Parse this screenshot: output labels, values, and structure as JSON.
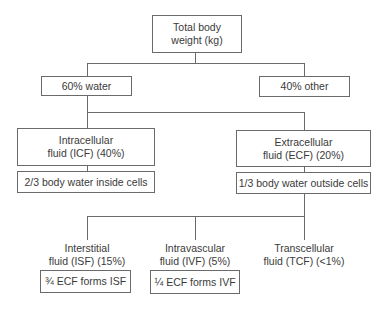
{
  "diagram": {
    "root": {
      "line1": "Total body",
      "line2": "weight (kg)"
    },
    "level1": {
      "water": "60% water",
      "other": "40% other"
    },
    "level2": {
      "icf": {
        "line1": "Intracellular",
        "line2": "fluid (ICF) (40%)",
        "note": "2/3 body water inside cells"
      },
      "ecf": {
        "line1": "Extracellular",
        "line2": "fluid (ECF) (20%)",
        "note": "1/3 body water outside cells"
      }
    },
    "level3": {
      "isf": {
        "line1": "Interstitial",
        "line2": "fluid (ISF) (15%)",
        "note": "¾ ECF forms ISF"
      },
      "ivf": {
        "line1": "Intravascular",
        "line2": "fluid (IVF) (5%)",
        "note": "¼ ECF forms IVF"
      },
      "tcf": {
        "line1": "Transcellular",
        "line2": "fluid (TCF) (<1%)"
      }
    }
  }
}
